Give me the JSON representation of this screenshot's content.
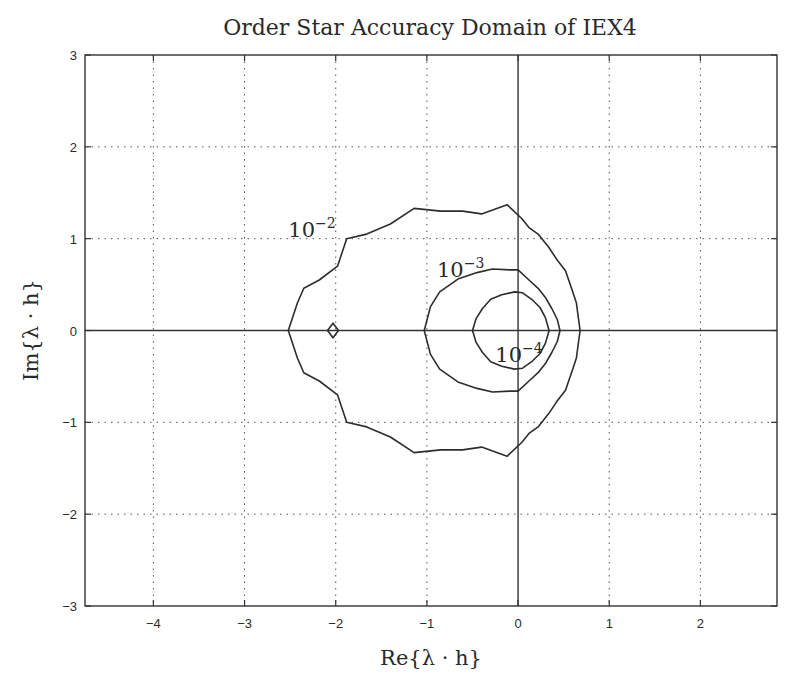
{
  "chart_data": {
    "type": "line",
    "title": "Order Star Accuracy Domain of IEX4",
    "xlabel": "Re{λ · h}",
    "ylabel": "Im{λ · h}",
    "xlim": [
      -4.75,
      2.84
    ],
    "ylim": [
      -3,
      3
    ],
    "grid": true,
    "legend": null,
    "x_ticks": [
      -4,
      -3,
      -2,
      -1,
      0,
      1,
      2
    ],
    "x_tick_labels": [
      "−4",
      "−3",
      "−2",
      "−1",
      "0",
      "1",
      "2"
    ],
    "y_ticks": [
      3,
      2,
      1,
      0,
      -1,
      -2,
      -3
    ],
    "y_tick_labels": [
      "3",
      "2",
      "1",
      "0",
      "−1",
      "−2",
      "−3"
    ],
    "reference_lines": {
      "x": 0,
      "y": 0
    },
    "series": [
      {
        "name": "10^-2",
        "label_base": "10",
        "label_exp": "−2",
        "label_pos": [
          -2.52,
          1.02
        ],
        "closed": true,
        "points_upper_half": [
          [
            -2.52,
            0.0
          ],
          [
            -2.42,
            0.3
          ],
          [
            -2.35,
            0.46
          ],
          [
            -2.18,
            0.55
          ],
          [
            -1.98,
            0.7
          ],
          [
            -1.88,
            1.0
          ],
          [
            -1.66,
            1.05
          ],
          [
            -1.4,
            1.16
          ],
          [
            -1.14,
            1.33
          ],
          [
            -0.85,
            1.3
          ],
          [
            -0.61,
            1.3
          ],
          [
            -0.4,
            1.27
          ],
          [
            -0.12,
            1.37
          ],
          [
            0.04,
            1.22
          ],
          [
            0.12,
            1.12
          ],
          [
            0.22,
            1.05
          ],
          [
            0.34,
            0.9
          ],
          [
            0.42,
            0.78
          ],
          [
            0.52,
            0.65
          ],
          [
            0.6,
            0.42
          ],
          [
            0.64,
            0.3
          ],
          [
            0.66,
            0.15
          ],
          [
            0.68,
            0.0
          ]
        ]
      },
      {
        "name": "10^-3",
        "label_base": "10",
        "label_exp": "−3",
        "label_pos": [
          -0.89,
          0.58
        ],
        "closed": true,
        "points_upper_half": [
          [
            -1.03,
            0.0
          ],
          [
            -0.96,
            0.26
          ],
          [
            -0.86,
            0.42
          ],
          [
            -0.66,
            0.56
          ],
          [
            -0.45,
            0.63
          ],
          [
            -0.28,
            0.67
          ],
          [
            -0.09,
            0.66
          ],
          [
            0.0,
            0.66
          ],
          [
            0.12,
            0.55
          ],
          [
            0.22,
            0.46
          ],
          [
            0.3,
            0.36
          ],
          [
            0.37,
            0.24
          ],
          [
            0.43,
            0.12
          ],
          [
            0.46,
            0.0
          ]
        ]
      },
      {
        "name": "10^-4",
        "label_base": "10",
        "label_exp": "−4",
        "label_pos": [
          -0.25,
          -0.34
        ],
        "closed": true,
        "points_upper_half": [
          [
            -0.5,
            0.0
          ],
          [
            -0.46,
            0.13
          ],
          [
            -0.39,
            0.24
          ],
          [
            -0.3,
            0.34
          ],
          [
            -0.18,
            0.39
          ],
          [
            -0.04,
            0.42
          ],
          [
            0.05,
            0.41
          ],
          [
            0.15,
            0.34
          ],
          [
            0.24,
            0.25
          ],
          [
            0.3,
            0.14
          ],
          [
            0.34,
            0.0
          ]
        ]
      },
      {
        "name": "10^-2 island",
        "closed": true,
        "points": [
          [
            -2.09,
            0.0
          ],
          [
            -2.03,
            0.08
          ],
          [
            -1.97,
            0.0
          ],
          [
            -2.03,
            -0.08
          ]
        ]
      }
    ]
  }
}
